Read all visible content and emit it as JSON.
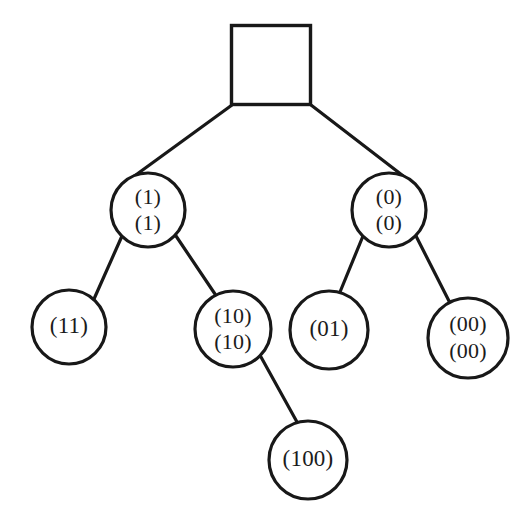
{
  "figure": {
    "type": "binary-tree-diagram",
    "background_color": "#ffffff",
    "stroke_color": "#181818",
    "text_color": "#1b1b1b"
  },
  "nodes": [
    {
      "id": "root",
      "shape": "square",
      "label_lines": [],
      "x": 271,
      "y": 65,
      "size": 79
    },
    {
      "id": "n1",
      "shape": "circle",
      "label_lines": [
        "(1)",
        "(1)"
      ],
      "line1": "(1)",
      "line2": "(1)",
      "x": 148,
      "y": 210,
      "r": 37
    },
    {
      "id": "n0",
      "shape": "circle",
      "label_lines": [
        "(0)",
        "(0)"
      ],
      "line1": "(0)",
      "line2": "(0)",
      "x": 389,
      "y": 210,
      "r": 37
    },
    {
      "id": "n11",
      "shape": "circle",
      "label_lines": [
        "(11)"
      ],
      "line1": "(11)",
      "x": 69,
      "y": 327,
      "r": 37
    },
    {
      "id": "n10",
      "shape": "circle",
      "label_lines": [
        "(10)",
        "(10)"
      ],
      "line1": "(10)",
      "line2": "(10)",
      "x": 233,
      "y": 329,
      "r": 38
    },
    {
      "id": "n01",
      "shape": "circle",
      "label_lines": [
        "(01)"
      ],
      "line1": "(01)",
      "x": 329,
      "y": 330,
      "r": 39
    },
    {
      "id": "n00",
      "shape": "circle",
      "label_lines": [
        "(00)",
        "(00)"
      ],
      "line1": "(00)",
      "line2": "(00)",
      "x": 468,
      "y": 338,
      "r": 40
    },
    {
      "id": "n100",
      "shape": "circle",
      "label_lines": [
        "(100)"
      ],
      "line1": "(100)",
      "x": 308,
      "y": 460,
      "r": 39
    }
  ],
  "edges": [
    {
      "id": "root-n1",
      "from": "root",
      "to": "n1",
      "x1": 232,
      "y1": 105,
      "x2": 122,
      "y2": 185
    },
    {
      "id": "root-n0",
      "from": "root",
      "to": "n0",
      "x1": 311,
      "y1": 105,
      "x2": 415,
      "y2": 185
    },
    {
      "id": "n1-n11",
      "from": "n1",
      "to": "n11",
      "x1": 122,
      "y1": 236,
      "x2": 94,
      "y2": 299
    },
    {
      "id": "n1-n10",
      "from": "n1",
      "to": "n10",
      "x1": 176,
      "y1": 236,
      "x2": 215,
      "y2": 294
    },
    {
      "id": "n0-n01",
      "from": "n0",
      "to": "n01",
      "x1": 363,
      "y1": 236,
      "x2": 340,
      "y2": 292
    },
    {
      "id": "n0-n00",
      "from": "n0",
      "to": "n00",
      "x1": 416,
      "y1": 236,
      "x2": 449,
      "y2": 301
    },
    {
      "id": "n10-n100",
      "from": "n10",
      "to": "n100",
      "x1": 261,
      "y1": 357,
      "x2": 297,
      "y2": 422
    }
  ]
}
